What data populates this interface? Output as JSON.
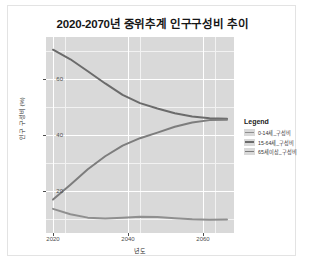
{
  "card": {
    "background": "#ffffff",
    "border_color": "#e3e3e3"
  },
  "chart_data": {
    "type": "line",
    "title": "2020-2070년 중위추계 인구구성비 추이",
    "xlabel": "년도",
    "ylabel": "인구 구성비 (%)",
    "xlim": [
      2020,
      2070
    ],
    "ylim": [
      5,
      75
    ],
    "xticks": [
      "2020",
      "2040",
      "2060"
    ],
    "xtick_values": [
      2020,
      2040,
      2060
    ],
    "yticks": [
      "20",
      "40",
      "60"
    ],
    "ytick_values": [
      20,
      40,
      60
    ],
    "grid": true,
    "legend_position": "right",
    "legend_title": "Legend",
    "panel_background": "#d9d9d9",
    "gridline_color": "#ffffff",
    "x": [
      2020,
      2025,
      2030,
      2035,
      2040,
      2045,
      2050,
      2055,
      2060,
      2065,
      2070
    ],
    "series": [
      {
        "name": "0-14세_구성비",
        "color": "#8f8f8f",
        "values": [
          12.2,
          10.2,
          8.9,
          8.6,
          8.9,
          9.2,
          9.1,
          8.7,
          8.3,
          8.1,
          8.2
        ]
      },
      {
        "name": "15-64세_구성비",
        "color": "#6b6b6b",
        "values": [
          72.1,
          68.5,
          64.0,
          59.4,
          55.1,
          52.0,
          50.0,
          48.2,
          47.0,
          46.3,
          46.1
        ]
      },
      {
        "name": "65세이상_구성비",
        "color": "#7d7d7d",
        "values": [
          15.7,
          21.3,
          27.1,
          32.0,
          36.0,
          38.8,
          40.9,
          43.1,
          44.7,
          45.6,
          45.7
        ]
      }
    ]
  }
}
